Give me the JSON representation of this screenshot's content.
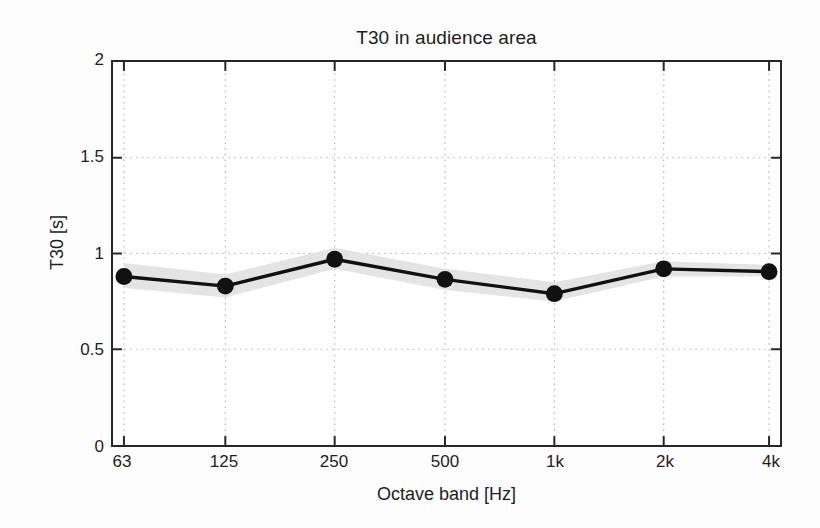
{
  "figure": {
    "title": "T30 in audience area",
    "background_color": "#fdfdfd",
    "axes_color": "#262626",
    "grid_color": "#b9b9b9",
    "line_color": "#111111",
    "band_color": "#e2e2e2"
  },
  "chart_data": {
    "type": "line",
    "title": "T30 in audience area",
    "xlabel": "Octave band [Hz]",
    "ylabel": "T30 [s]",
    "categories": [
      "63",
      "125",
      "250",
      "500",
      "1k",
      "2k",
      "4k"
    ],
    "x_tick_labels": [
      "63",
      "125",
      "250",
      "500",
      "1k",
      "2k",
      "4k"
    ],
    "y_tick_labels": [
      "0",
      "0.5",
      "1",
      "1.5",
      "2"
    ],
    "y_tick_values": [
      0,
      0.5,
      1,
      1.5,
      2
    ],
    "ylim": [
      0,
      2
    ],
    "grid": true,
    "grid_style": "dotted",
    "legend": null,
    "series": [
      {
        "name": "T30 mean",
        "marker": "filled-circle",
        "values": [
          0.88,
          0.83,
          0.97,
          0.865,
          0.79,
          0.92,
          0.905
        ]
      },
      {
        "name": "T30 spread (upper)",
        "values": [
          0.95,
          0.89,
          1.03,
          0.92,
          0.85,
          0.96,
          0.94
        ]
      },
      {
        "name": "T30 spread (lower)",
        "values": [
          0.82,
          0.77,
          0.92,
          0.81,
          0.75,
          0.88,
          0.88
        ]
      }
    ],
    "annotations": []
  },
  "axis": {
    "y_title": "T30 [s]",
    "x_title": "Octave band [Hz]",
    "y_ticks": [
      {
        "label": "2",
        "value": 2
      },
      {
        "label": "1.5",
        "value": 1.5
      },
      {
        "label": "1",
        "value": 1
      },
      {
        "label": "0.5",
        "value": 0.5
      },
      {
        "label": "0",
        "value": 0
      }
    ],
    "x_ticks": [
      {
        "label": "63"
      },
      {
        "label": "125"
      },
      {
        "label": "250"
      },
      {
        "label": "500"
      },
      {
        "label": "1k"
      },
      {
        "label": "2k"
      },
      {
        "label": "4k"
      }
    ]
  }
}
